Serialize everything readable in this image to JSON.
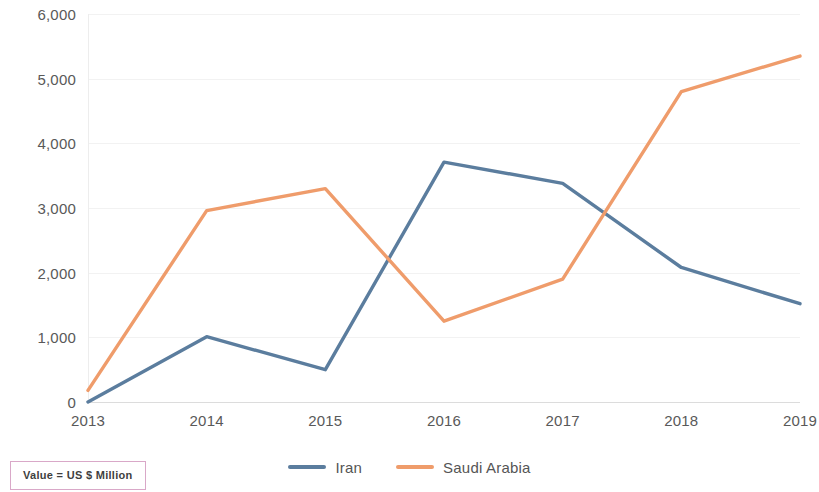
{
  "chart_data": {
    "type": "line",
    "title": "",
    "subtitle": "",
    "xlabel": "",
    "ylabel": "",
    "categories": [
      "2013",
      "2014",
      "2015",
      "2016",
      "2017",
      "2018",
      "2019"
    ],
    "ylim": [
      0,
      6000
    ],
    "ytick_labels": [
      "6,000",
      "5,000",
      "4,000",
      "3,000",
      "2,000",
      "1,000",
      "0"
    ],
    "ytick_values": [
      6000,
      5000,
      4000,
      3000,
      2000,
      1000,
      0
    ],
    "grid": true,
    "legend_position": "bottom",
    "series": [
      {
        "name": "Iran",
        "color": "#5b7d9e",
        "values": [
          0,
          1010,
          500,
          3710,
          3380,
          2080,
          1520
        ]
      },
      {
        "name": "Saudi Arabia",
        "color": "#ef9c6b",
        "values": [
          180,
          2960,
          3300,
          1250,
          1900,
          4800,
          5350
        ]
      }
    ],
    "annotations": [
      {
        "text": "Value = US $ Million"
      }
    ]
  },
  "legend": {
    "items": [
      {
        "label": "Iran",
        "color": "#5b7d9e"
      },
      {
        "label": "Saudi Arabia",
        "color": "#ef9c6b"
      }
    ]
  },
  "footnote": {
    "text": "Value = US $ Million",
    "border_color": "#d9a8c8"
  },
  "colors": {
    "iran": "#5b7d9e",
    "saudi_arabia": "#ef9c6b",
    "gridline": "#f2f2f2",
    "axis_text": "#595959",
    "background": "#ffffff"
  }
}
